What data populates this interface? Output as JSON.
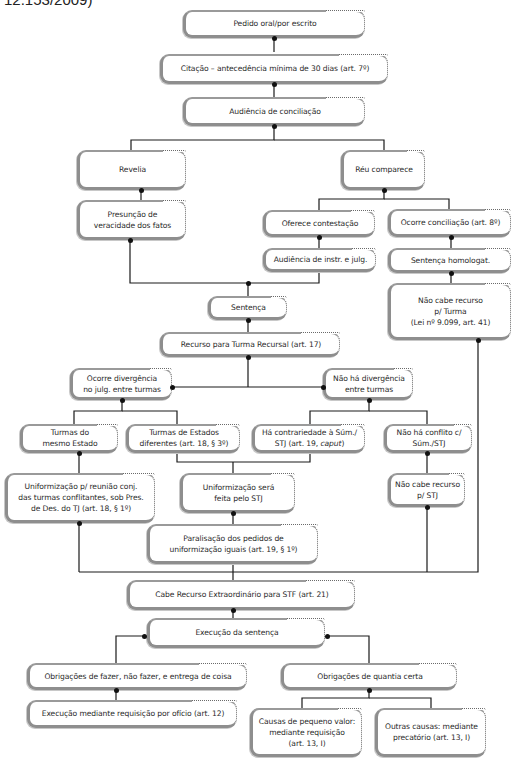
{
  "caption": "12.153/2009)",
  "nodes": {
    "pedido": "Pedido oral/por escrito",
    "citacao": "Citação – antecedência mínima de 30 dias (art. 7º)",
    "audiencia_conciliacao": "Audiência de conciliação",
    "revelia": "Revelia",
    "reu_comparece": "Réu comparece",
    "presuncao": "Presunção de\nveracidade dos fatos",
    "oferece_contestacao": "Oferece contestação",
    "ocorre_conciliacao": "Ocorre conciliação (art. 8º)",
    "audiencia_instr": "Audiência de instr. e julg.",
    "sentenca_homologat": "Sentença homologat.",
    "sentenca": "Sentença",
    "nao_cabe_turma": "Não cabe recurso\np/ Turma\n(Lei nº 9.099, art. 41)",
    "recurso_turma": "Recurso para Turma Recursal (art. 17)",
    "ocorre_divergencia": "Ocorre divergência\nno julg. entre turmas",
    "nao_ha_divergencia": "Não há divergência\nentre turmas",
    "turmas_mesmo_estado": "Turmas do\nmesmo Estado",
    "turmas_estados_diferentes": "Turmas de Estados\ndiferentes (art. 18, § 3º)",
    "ha_contrariedade_a": "Há contrariedade à Súm./\nSTJ (art. 19, ",
    "ha_contrariedade_caput": "caput",
    "ha_contrariedade_b": ")",
    "nao_ha_conflito": "Não há conflito c/\nSúm./STJ",
    "uniformizacao_reuniao": "Uniformização p/ reunião conj.\ndas turmas conflitantes, sob Pres.\nde Des. do TJ (art. 18, § 1º)",
    "uniformizacao_stj": "Uniformização será\nfeita pelo STJ",
    "nao_cabe_stj": "Não cabe recurso\np/ STJ",
    "paralisacao": "Paralisação dos pedidos de\nuniformização iguais (art. 19, § 1º)",
    "cabe_re": "Cabe Recurso Extraordinário para STF (art. 21)",
    "execucao": "Execução da sentença",
    "obrig_fazer": "Obrigações de fazer, não fazer, e entrega de coisa",
    "obrig_quantia": "Obrigações de quantia certa",
    "execucao_oficio": "Execução mediante requisição por ofício (art. 12)",
    "pequeno_valor": "Causas de pequeno valor:\nmediante requisição\n(art. 13, I)",
    "outras_causas": "Outras causas: mediante\nprecatório (art. 13, I)"
  },
  "colors": {
    "line": "#1a1a1a",
    "border": "#8e8e8e",
    "text": "#2a2a2a"
  }
}
